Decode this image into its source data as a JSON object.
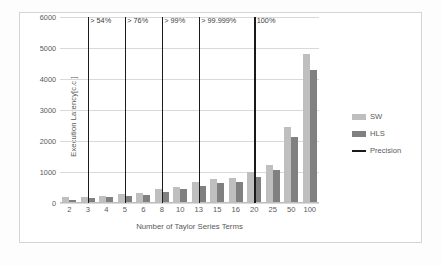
{
  "chart_data": {
    "type": "bar",
    "title": "",
    "xlabel": "Number of Taylor Series Terms",
    "ylabel": "Execution Latency[c.c.]",
    "categories": [
      "2",
      "3",
      "4",
      "5",
      "6",
      "8",
      "10",
      "13",
      "15",
      "16",
      "20",
      "25",
      "50",
      "100"
    ],
    "ylim": [
      0,
      6000
    ],
    "yticks": [
      "0",
      "1000",
      "2000",
      "3000",
      "4000",
      "5000",
      "6000"
    ],
    "grid": true,
    "legend_position": "right",
    "series": [
      {
        "name": "SW",
        "color": "#bfbfbf",
        "values": [
          210,
          190,
          215,
          290,
          330,
          440,
          530,
          680,
          760,
          820,
          1010,
          1230,
          2450,
          4810
        ]
      },
      {
        "name": "HLS",
        "color": "#808080",
        "values": [
          90,
          150,
          180,
          225,
          265,
          360,
          440,
          565,
          655,
          690,
          855,
          1070,
          2130,
          4300
        ]
      },
      {
        "name": "Precision",
        "color": "#1a1a1a",
        "type": "vline",
        "marks": [
          {
            "category": "3",
            "label": "> 54%"
          },
          {
            "category": "5",
            "label": "> 76%"
          },
          {
            "category": "8",
            "label": "> 99%"
          },
          {
            "category": "13",
            "label": "> 99.999%"
          },
          {
            "category": "20",
            "label": "100%"
          }
        ]
      }
    ]
  },
  "legend": {
    "items": [
      {
        "label": "SW"
      },
      {
        "label": "HLS"
      },
      {
        "label": "Precision"
      }
    ]
  }
}
